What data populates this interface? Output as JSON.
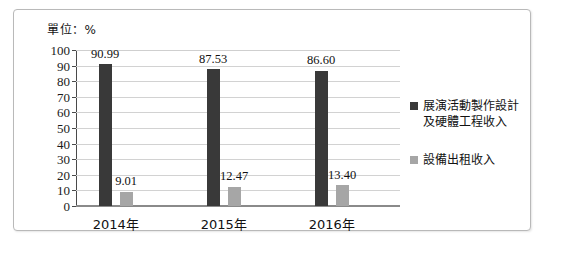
{
  "unit_note": "單位：%",
  "legend": {
    "items": [
      {
        "label": "展演活動製作設計\n及硬體工程收入",
        "color": "#393939",
        "swatch_icon": "square-swatch-icon"
      },
      {
        "label": "設備出租收入",
        "color": "#a6a6a6",
        "swatch_icon": "square-swatch-icon"
      }
    ]
  },
  "chart_data": {
    "type": "bar",
    "title": "",
    "subtitle": "",
    "xlabel": "",
    "ylabel": "單位：%",
    "categories": [
      "2014年",
      "2015年",
      "2016年"
    ],
    "series": [
      {
        "name": "展演活動製作設計及硬體工程收入",
        "color": "#393939",
        "values": [
          90.99,
          87.53,
          86.6
        ]
      },
      {
        "name": "設備出租收入",
        "color": "#a6a6a6",
        "values": [
          9.01,
          12.47,
          13.4
        ]
      }
    ],
    "data_labels": [
      [
        "90.99",
        "87.53",
        "86.60"
      ],
      [
        "9.01",
        "12.47",
        "13.40"
      ]
    ],
    "ylim": [
      0,
      100
    ],
    "ytick_step": 10,
    "yticks": [
      100,
      90,
      80,
      70,
      60,
      50,
      40,
      30,
      20,
      10,
      0
    ],
    "ytick_labels": [
      "100",
      "90",
      "80",
      "70",
      "60",
      "50",
      "40",
      "30",
      "20",
      "10",
      "0"
    ],
    "grid": true,
    "legend_position": "right"
  }
}
